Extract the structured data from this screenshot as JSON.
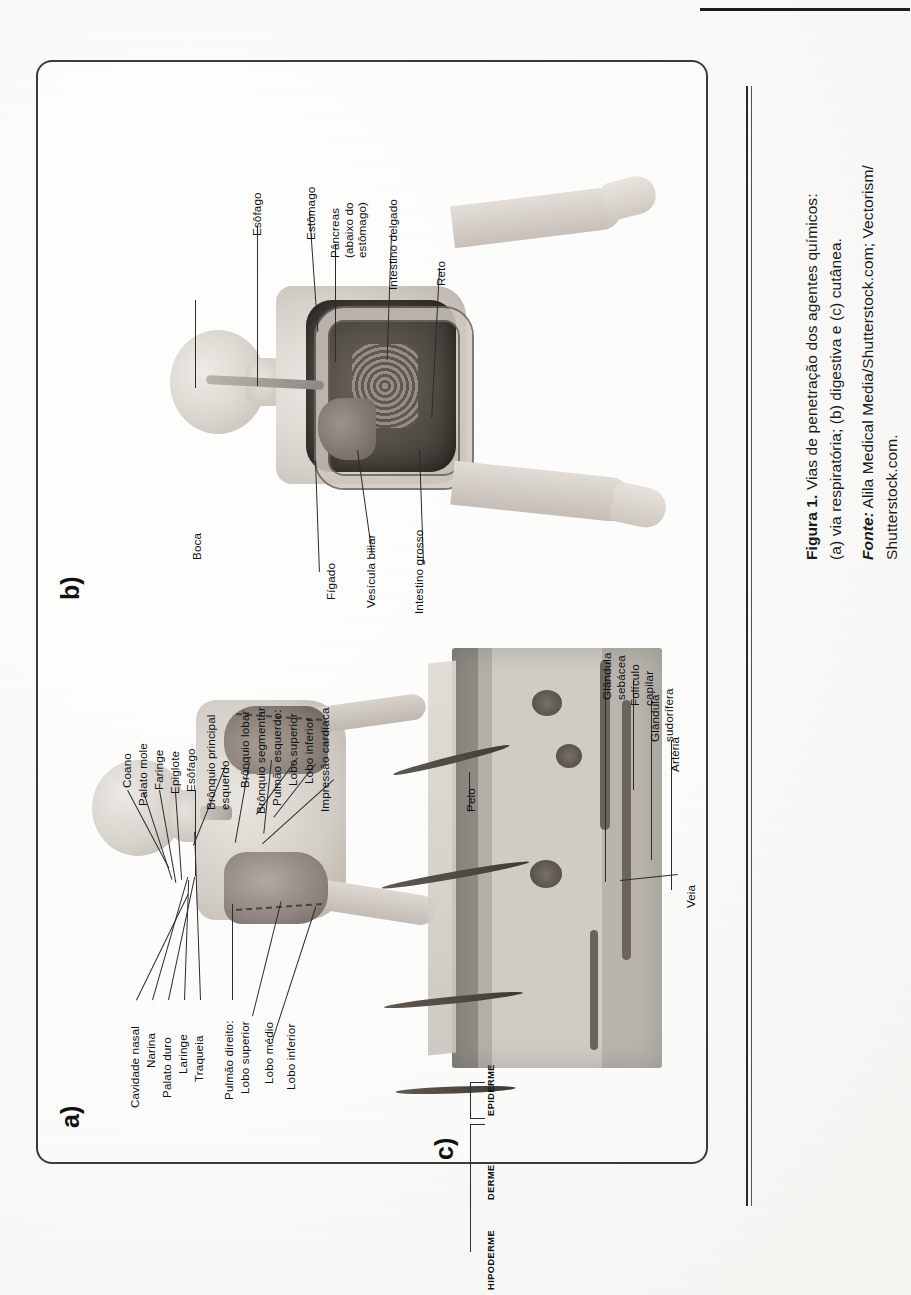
{
  "document": {
    "type": "scanned-textbook-page",
    "orientation": "rotated-90-ccw"
  },
  "figure": {
    "caption_title": "Figura 1.",
    "caption_text": "Vias de penetração dos agentes químicos:",
    "caption_line2": "(a) via respiratória; (b) digestiva e (c) cutânea.",
    "source_label": "Fonte:",
    "source_text": "Alila Medical Media/Shutterstock.com; Vectorism/",
    "source_text2": "Shutterstock.com."
  },
  "panels": {
    "a": {
      "letter": "a)",
      "title": "via respiratória",
      "labels": [
        {
          "id": "coano",
          "text": "Coano"
        },
        {
          "id": "palato-mole",
          "text": "Palato mole"
        },
        {
          "id": "faringe",
          "text": "Faringe"
        },
        {
          "id": "epiglote",
          "text": "Epiglote"
        },
        {
          "id": "esofago",
          "text": "Esôfago"
        },
        {
          "id": "bronquio-principal-esquerdo",
          "text": "Brônquio principal\nesquerdo"
        },
        {
          "id": "bronquio-lobar",
          "text": "Brônquio lobar"
        },
        {
          "id": "bronquio-segmentar",
          "text": "Brônquio segmentar"
        },
        {
          "id": "pulmao-esquerdo",
          "text": "Pulmão esquerdo:"
        },
        {
          "id": "lobo-superior-esq",
          "text": "Lobo superior"
        },
        {
          "id": "lobo-inferior-esq",
          "text": "Lobo inferior"
        },
        {
          "id": "impressao-cardiaca",
          "text": "Impressão cardíaca"
        },
        {
          "id": "cavidade-nasal",
          "text": "Cavidade nasal"
        },
        {
          "id": "narina",
          "text": "Narina"
        },
        {
          "id": "palato-duro",
          "text": "Palato duro"
        },
        {
          "id": "laringe",
          "text": "Laringe"
        },
        {
          "id": "traqueia",
          "text": "Traqueia"
        },
        {
          "id": "pulmao-direito",
          "text": "Pulmão direito:"
        },
        {
          "id": "lobo-superior-dir",
          "text": "Lobo superior"
        },
        {
          "id": "lobo-medio",
          "text": "Lobo médio"
        },
        {
          "id": "lobo-inferior-dir",
          "text": "Lobo inferior"
        }
      ]
    },
    "b": {
      "letter": "b)",
      "title": "via digestiva",
      "labels": [
        {
          "id": "esofago",
          "text": "Esôfago"
        },
        {
          "id": "estomago",
          "text": "Estômago"
        },
        {
          "id": "pancreas",
          "text": "Pâncreas\n(abaixo do\nestômago)"
        },
        {
          "id": "intestino-delgado",
          "text": "Intestino delgado"
        },
        {
          "id": "reto",
          "text": "Reto"
        },
        {
          "id": "boca",
          "text": "Boca"
        },
        {
          "id": "figado",
          "text": "Fígado"
        },
        {
          "id": "vesicula-biliar",
          "text": "Vesícula biliar"
        },
        {
          "id": "intestino-grosso",
          "text": "Intestino grosso"
        }
      ]
    },
    "c": {
      "letter": "c)",
      "title": "via cutânea",
      "labels": [
        {
          "id": "pelo",
          "text": "Pelo"
        },
        {
          "id": "glandula-sebacea",
          "text": "Glândula\nsebácea"
        },
        {
          "id": "foliculo-capilar",
          "text": "Folículo\ncapilar"
        },
        {
          "id": "glandula-sudorifera",
          "text": "Glândula\nsudorífera"
        },
        {
          "id": "arteria",
          "text": "Artéria"
        },
        {
          "id": "veia",
          "text": "Veia"
        }
      ],
      "layers": [
        {
          "id": "epiderme",
          "text": "EPIDERME"
        },
        {
          "id": "derme",
          "text": "DERME"
        },
        {
          "id": "hipoderme",
          "text": "HIPODERME"
        }
      ]
    }
  },
  "colors": {
    "ink": "#111111",
    "rule": "#2b2b2b",
    "paper": "#f8f8f6"
  }
}
